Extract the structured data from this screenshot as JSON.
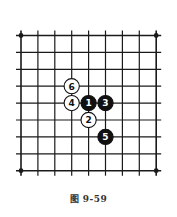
{
  "figure": {
    "caption": "图 9-59"
  },
  "board": {
    "size": 9,
    "origin_x": 21,
    "origin_y": 35.5,
    "spacing": 16.9,
    "line_color": "#1a1a1a",
    "star_points": [
      [
        0,
        0
      ],
      [
        8,
        0
      ],
      [
        0,
        8
      ],
      [
        8,
        8
      ]
    ]
  },
  "stones": [
    {
      "move": "1",
      "color": "black",
      "col": 4,
      "row": 4
    },
    {
      "move": "2",
      "color": "white",
      "col": 4,
      "row": 5
    },
    {
      "move": "3",
      "color": "black",
      "col": 5,
      "row": 4
    },
    {
      "move": "4",
      "color": "white",
      "col": 3,
      "row": 4
    },
    {
      "move": "5",
      "color": "black",
      "col": 5,
      "row": 6
    },
    {
      "move": "6",
      "color": "white",
      "col": 3,
      "row": 3
    }
  ]
}
